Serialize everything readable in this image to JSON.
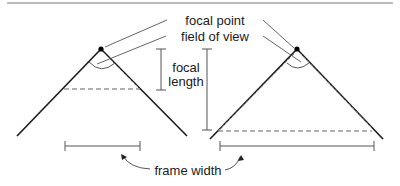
{
  "labels": {
    "focal_point": "focal point",
    "field_of_view": "field of view",
    "focal_length_line1": "focal",
    "focal_length_line2": "length",
    "frame_width": "frame width"
  },
  "colors": {
    "line": "#1a1a1a",
    "thin": "#555555",
    "dashed": "#666666",
    "rule": "#777777"
  },
  "diagrams": [
    {
      "name": "short-focal-length",
      "apex": [
        101,
        49
      ],
      "focal_length": "short",
      "field_of_view": "wide"
    },
    {
      "name": "long-focal-length",
      "apex": [
        297,
        49
      ],
      "focal_length": "long",
      "field_of_view": "narrow"
    }
  ]
}
